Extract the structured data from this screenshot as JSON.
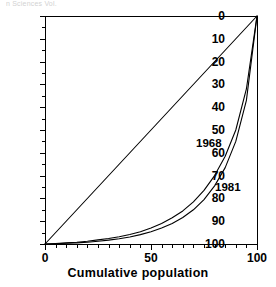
{
  "figure": {
    "top_text_fragment": "n Sciences Vol.",
    "background": "#ffffff",
    "ink_color": "#000000"
  },
  "axes": {
    "y_tick_labels": [
      "100",
      "90",
      "80",
      "70",
      "60",
      "50",
      "40",
      "30",
      "20",
      "10",
      "0"
    ],
    "y_tick_values": [
      100,
      90,
      80,
      70,
      60,
      50,
      40,
      30,
      20,
      10,
      0
    ],
    "x_tick_labels": [
      "0",
      "50",
      "100"
    ],
    "x_tick_values": [
      0,
      50,
      100
    ],
    "x_title": "Cumulative population",
    "y_title": ""
  },
  "annotations": {
    "curve_label_upper": "1968",
    "curve_label_lower": "1981"
  },
  "chart_data": {
    "type": "line",
    "title": "",
    "subtitle": "",
    "xlabel": "Cumulative population",
    "ylabel": "",
    "xlim": [
      0,
      100
    ],
    "ylim": [
      0,
      100
    ],
    "grid": false,
    "legend_position": "inline-annotations",
    "x_major_ticks": [
      0,
      50,
      100
    ],
    "x_minor_tick_interval": 5,
    "y_major_ticks": [
      0,
      10,
      20,
      30,
      40,
      50,
      60,
      70,
      80,
      90,
      100
    ],
    "y_minor_tick_interval": 5,
    "series": [
      {
        "name": "line-of-equality",
        "label": "",
        "color": "#000000",
        "x": [
          0,
          100
        ],
        "values": [
          0,
          100
        ]
      },
      {
        "name": "1968",
        "label": "1968",
        "color": "#000000",
        "x": [
          0,
          5,
          10,
          15,
          20,
          25,
          30,
          35,
          40,
          45,
          50,
          55,
          60,
          65,
          70,
          75,
          80,
          85,
          90,
          95,
          100
        ],
        "values": [
          0,
          0.2,
          0.5,
          0.8,
          1.2,
          1.8,
          2.4,
          3.2,
          4.2,
          5.4,
          7.0,
          9.0,
          11.5,
          14.5,
          18.5,
          23.5,
          30.0,
          38.5,
          50.0,
          68.0,
          100.0
        ]
      },
      {
        "name": "1981",
        "label": "1981",
        "color": "#000000",
        "x": [
          0,
          5,
          10,
          15,
          20,
          25,
          30,
          35,
          40,
          45,
          50,
          55,
          60,
          65,
          70,
          75,
          80,
          85,
          90,
          95,
          100
        ],
        "values": [
          0,
          0.1,
          0.3,
          0.5,
          0.8,
          1.2,
          1.7,
          2.3,
          3.1,
          4.1,
          5.4,
          7.0,
          9.0,
          11.6,
          15.0,
          19.5,
          25.5,
          33.5,
          45.0,
          63.0,
          100.0
        ]
      }
    ]
  }
}
